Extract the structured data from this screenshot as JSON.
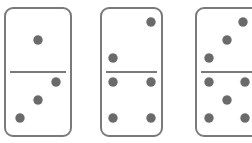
{
  "colors": {
    "border": "#7a7a7a",
    "pip": "#6a6a6a",
    "background": "#ffffff"
  },
  "dominoes": [
    {
      "top_value": 1,
      "bottom_value": 3,
      "box": {
        "x": 4,
        "y": 7,
        "w": 68,
        "h": 130
      },
      "divider_y": 71,
      "pips": [
        [
          38,
          40
        ],
        [
          56,
          82
        ],
        [
          38,
          100
        ],
        [
          20,
          118
        ]
      ]
    },
    {
      "top_value": 2,
      "bottom_value": 4,
      "box": {
        "x": 100,
        "y": 7,
        "w": 63,
        "h": 130
      },
      "divider_y": 71,
      "pips": [
        [
          151,
          22
        ],
        [
          113,
          58
        ],
        [
          113,
          82
        ],
        [
          151,
          82
        ],
        [
          113,
          118
        ],
        [
          151,
          118
        ]
      ]
    },
    {
      "top_value": 3,
      "bottom_value": 5,
      "box": {
        "x": 195,
        "y": 7,
        "w": 66,
        "h": 130
      },
      "divider_y": 71,
      "pips": [
        [
          243,
          22
        ],
        [
          227,
          40
        ],
        [
          209,
          58
        ],
        [
          209,
          82
        ],
        [
          245,
          82
        ],
        [
          227,
          100
        ],
        [
          209,
          118
        ],
        [
          245,
          118
        ]
      ]
    }
  ]
}
